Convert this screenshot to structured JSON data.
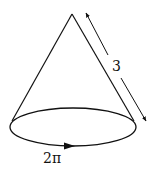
{
  "diagram": {
    "type": "cone",
    "labels": {
      "slant_height": "3",
      "base_circumference": "2π"
    },
    "colors": {
      "stroke": "#111111",
      "background": "#ffffff"
    }
  }
}
